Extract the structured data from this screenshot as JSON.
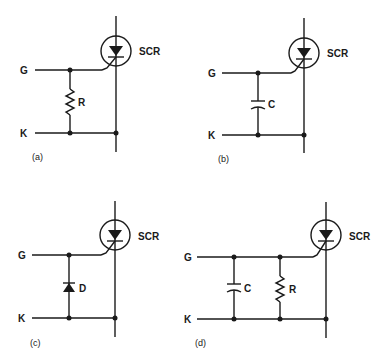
{
  "figure": {
    "panels": [
      {
        "id": "a",
        "caption": "(a)",
        "device_label": "SCR",
        "gate_label": "G",
        "cathode_label": "K",
        "components": [
          {
            "type": "resistor",
            "label": "R"
          }
        ]
      },
      {
        "id": "b",
        "caption": "(b)",
        "device_label": "SCR",
        "gate_label": "G",
        "cathode_label": "K",
        "components": [
          {
            "type": "capacitor",
            "label": "C"
          }
        ]
      },
      {
        "id": "c",
        "caption": "(c)",
        "device_label": "SCR",
        "gate_label": "G",
        "cathode_label": "K",
        "components": [
          {
            "type": "diode",
            "label": "D"
          }
        ]
      },
      {
        "id": "d",
        "caption": "(d)",
        "device_label": "SCR",
        "gate_label": "G",
        "cathode_label": "K",
        "components": [
          {
            "type": "capacitor",
            "label": "C"
          },
          {
            "type": "resistor",
            "label": "R"
          }
        ]
      }
    ]
  }
}
